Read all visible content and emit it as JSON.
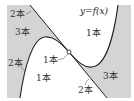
{
  "diagram": {
    "curve_label": "y=f(x)",
    "colors": {
      "shaded": "#d4d4d4",
      "line": "#222222",
      "background": "#ffffff"
    },
    "regions": [
      {
        "id": "top-left-edge",
        "label": "2本",
        "shaded": true
      },
      {
        "id": "top-left",
        "label": "3本",
        "shaded": true
      },
      {
        "id": "left-edge",
        "label": "2本",
        "shaded": true
      },
      {
        "id": "upper-right",
        "label": "1本",
        "shaded": false
      },
      {
        "id": "inflection-point",
        "label": "1本",
        "shaded": false
      },
      {
        "id": "lower-center",
        "label": "1本",
        "shaded": false
      },
      {
        "id": "lower-right",
        "label": "3本",
        "shaded": true
      },
      {
        "id": "tangent-line-lower",
        "label": "2本",
        "shaded": false
      }
    ]
  }
}
